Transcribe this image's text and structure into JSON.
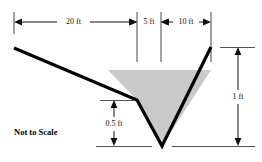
{
  "figure": {
    "note": "Not to Scale",
    "colors": {
      "water_fill": "#c9c9c9",
      "bank_stroke": "#000000",
      "dimension": "#111111",
      "extension": "#444444",
      "background": "#ffffff"
    },
    "dimensions": [
      {
        "id": "top-left-span",
        "label": "20 ft",
        "orientation": "horizontal",
        "value": 20,
        "unit": "ft"
      },
      {
        "id": "top-mid-span",
        "label": "5 ft",
        "orientation": "horizontal",
        "value": 5,
        "unit": "ft"
      },
      {
        "id": "top-right-span",
        "label": "10 ft",
        "orientation": "horizontal",
        "value": 10,
        "unit": "ft"
      },
      {
        "id": "left-depth",
        "label": "0.5 ft",
        "orientation": "vertical",
        "value": 0.5,
        "unit": "ft"
      },
      {
        "id": "right-depth",
        "label": "1 ft",
        "orientation": "vertical",
        "value": 1,
        "unit": "ft"
      }
    ],
    "geometry": {
      "left_bank": "gentle slope from top-left down to channel shoulder",
      "v_notch": "steep V descending to invert then rising to right bank top",
      "water_surface": "horizontal shaded region"
    }
  }
}
